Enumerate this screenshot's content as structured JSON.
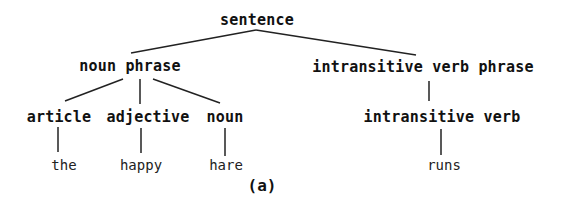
{
  "diagram": {
    "type": "parse-tree",
    "caption": "(a)",
    "line_color": "#222222",
    "nodes": {
      "sentence": "sentence",
      "noun_phrase": "noun phrase",
      "intransitive_verb_phrase": "intransitive verb phrase",
      "article": "article",
      "adjective": "adjective",
      "noun": "noun",
      "intransitive_verb": "intransitive verb",
      "the": "the",
      "happy": "happy",
      "hare": "hare",
      "runs": "runs"
    },
    "edges": [
      [
        "sentence",
        "noun phrase"
      ],
      [
        "sentence",
        "intransitive verb phrase"
      ],
      [
        "noun phrase",
        "article"
      ],
      [
        "noun phrase",
        "adjective"
      ],
      [
        "noun phrase",
        "noun"
      ],
      [
        "intransitive verb phrase",
        "intransitive verb"
      ],
      [
        "article",
        "the"
      ],
      [
        "adjective",
        "happy"
      ],
      [
        "noun",
        "hare"
      ],
      [
        "intransitive verb",
        "runs"
      ]
    ]
  }
}
